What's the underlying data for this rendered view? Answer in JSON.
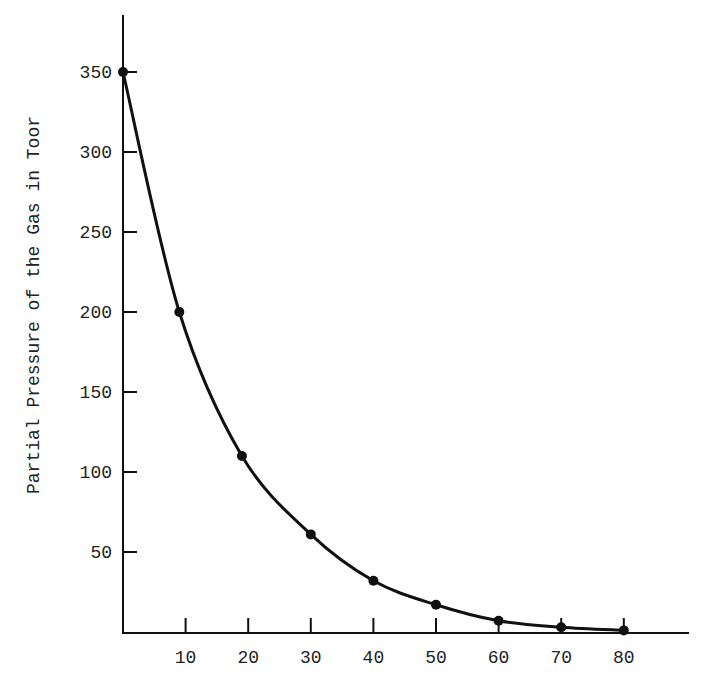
{
  "chart_data": {
    "type": "line",
    "title": "",
    "xlabel": "",
    "ylabel": "Partial Pressure of the Gas in Toor",
    "x": [
      0,
      9,
      19,
      30,
      40,
      50,
      60,
      70,
      80
    ],
    "series": [
      {
        "name": "Partial Pressure",
        "values": [
          350,
          200,
          110,
          61,
          32,
          17,
          7,
          3,
          1
        ],
        "markers": true,
        "smooth": true
      }
    ],
    "xticks": [
      10,
      20,
      30,
      40,
      50,
      60,
      70,
      80
    ],
    "xtick_labels": [
      "10",
      "20",
      "30",
      "40",
      "50",
      "60",
      "70",
      "80"
    ],
    "yticks": [
      50,
      100,
      150,
      200,
      250,
      300,
      350
    ],
    "ytick_labels": [
      "50",
      "100",
      "150",
      "200",
      "250",
      "300",
      "350"
    ],
    "xlim": [
      0,
      90
    ],
    "ylim": [
      0,
      390
    ],
    "grid": false,
    "legend": "none"
  },
  "colors": {
    "line": "#111111",
    "axis": "#111111",
    "text": "#222222",
    "background": "#ffffff"
  }
}
